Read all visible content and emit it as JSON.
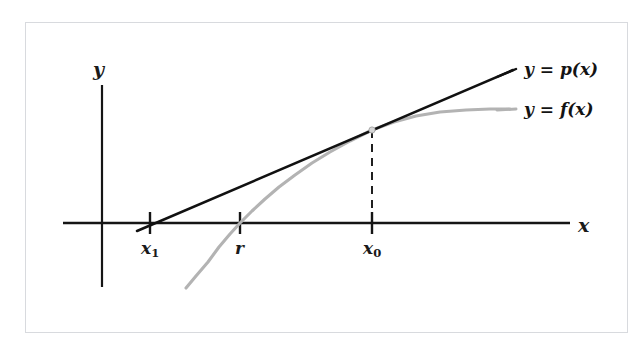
{
  "figure": {
    "kind": "newton-method-diagram",
    "background_color": "#ffffff",
    "frame_color": "#d8dade",
    "line_color": "#111111",
    "curve_color": "#b3b3b3",
    "axis_color": "#151515"
  },
  "axes": {
    "x_label": "x",
    "y_label": "y"
  },
  "ticks": [
    {
      "id": "x1",
      "base": "x",
      "sub": "1",
      "x_px": 150
    },
    {
      "id": "r",
      "base": "r",
      "sub": "",
      "x_px": 240
    },
    {
      "id": "x0",
      "base": "x",
      "sub": "0",
      "x_px": 372
    }
  ],
  "legend": [
    {
      "id": "p",
      "text": "y = p(x)",
      "color": "#111111",
      "style": "solid"
    },
    {
      "id": "f",
      "text": "y = f(x)",
      "color": "#b3b3b3",
      "style": "solid"
    }
  ],
  "chart_data": {
    "type": "line",
    "title": "",
    "xlabel": "x",
    "ylabel": "y",
    "grid": false,
    "legend_position": "right",
    "axis_pixels": {
      "x_axis_y": 223,
      "y_axis_x": 102
    },
    "annotations": [
      {
        "label": "x1",
        "type": "x-tick",
        "x": 150,
        "note": "root of the tangent line p(x)"
      },
      {
        "label": "r",
        "type": "x-tick",
        "x": 240,
        "note": "true root of f(x)"
      },
      {
        "label": "x0",
        "type": "x-tick",
        "x": 372,
        "note": "current iterate; tangency point"
      },
      {
        "label": "tangency-point",
        "type": "point",
        "x": 372,
        "y": 130
      },
      {
        "label": "dashed-drop-line",
        "type": "vline",
        "x": 372,
        "y_from": 223,
        "y_to": 131
      }
    ],
    "series": [
      {
        "name": "y = p(x)",
        "style": "solid",
        "color": "#111111",
        "role": "tangent-line",
        "points": [
          [
            137,
            231
          ],
          [
            513,
            70
          ]
        ]
      },
      {
        "name": "y = f(x)",
        "style": "solid",
        "color": "#b3b3b3",
        "role": "function-curve",
        "points": [
          [
            186,
            288
          ],
          [
            196,
            276
          ],
          [
            208,
            262
          ],
          [
            219,
            247
          ],
          [
            230,
            234
          ],
          [
            240,
            223
          ],
          [
            252,
            211
          ],
          [
            265,
            199
          ],
          [
            279,
            187
          ],
          [
            295,
            175
          ],
          [
            312,
            163
          ],
          [
            330,
            152
          ],
          [
            350,
            141
          ],
          [
            372,
            130
          ],
          [
            394,
            122
          ],
          [
            416,
            116
          ],
          [
            440,
            112
          ],
          [
            466,
            110
          ],
          [
            490,
            109
          ],
          [
            510,
            109
          ]
        ]
      }
    ]
  }
}
